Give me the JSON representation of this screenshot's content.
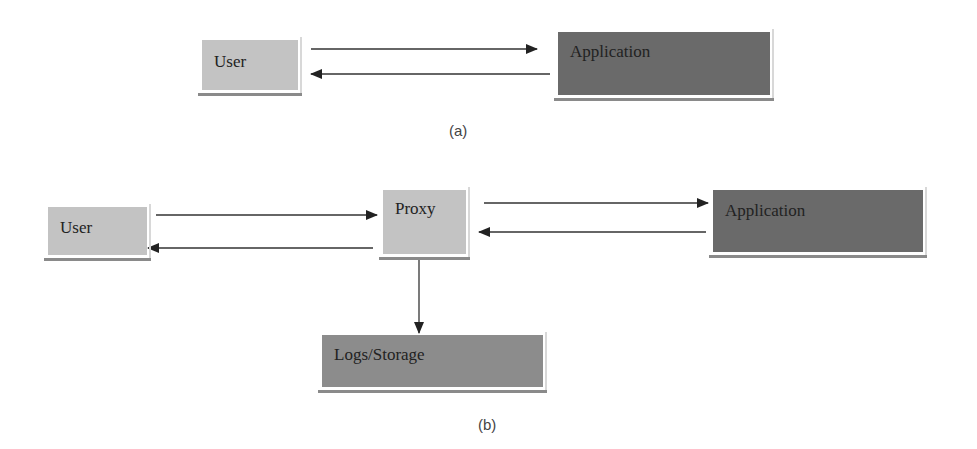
{
  "diagram_a": {
    "caption": "(a)",
    "nodes": {
      "user": "User",
      "application": "Application"
    },
    "edges": [
      {
        "from": "User",
        "to": "Application"
      },
      {
        "from": "Application",
        "to": "User"
      }
    ]
  },
  "diagram_b": {
    "caption": "(b)",
    "nodes": {
      "user": "User",
      "proxy": "Proxy",
      "application": "Application",
      "logs": "Logs/Storage"
    },
    "edges": [
      {
        "from": "User",
        "to": "Proxy"
      },
      {
        "from": "Proxy",
        "to": "User"
      },
      {
        "from": "Proxy",
        "to": "Application"
      },
      {
        "from": "Application",
        "to": "Proxy"
      },
      {
        "from": "Proxy",
        "to": "Logs/Storage"
      }
    ]
  },
  "colors": {
    "user_box": "#c3c3c3",
    "proxy_box": "#c3c3c3",
    "application_box": "#6a6a6a",
    "logs_box": "#8c8c8c",
    "arrow": "#222222"
  }
}
